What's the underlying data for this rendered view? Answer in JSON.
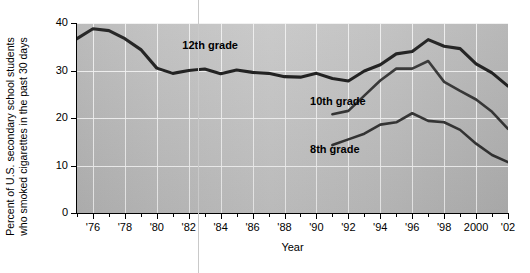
{
  "chart_data": {
    "type": "line",
    "title": "",
    "xlabel": "Year",
    "ylabel": "Percent of U.S. secondary school students who smoked cigarettes in the past 30 days",
    "ylabel_lines": [
      "Percent of U.S. secondary school students",
      "who smoked cigarettes in the past 30 days"
    ],
    "xlim": [
      1975,
      2002
    ],
    "ylim": [
      0,
      40
    ],
    "ytick_labels": [
      "0",
      "10",
      "20",
      "30",
      "40"
    ],
    "ytick_values": [
      0,
      10,
      20,
      30,
      40
    ],
    "xtick_labels": [
      "'76",
      "'78",
      "'80",
      "'82",
      "'84",
      "'86",
      "'88",
      "'90",
      "'92",
      "'94",
      "'96",
      "'98",
      "2000",
      "'02"
    ],
    "xtick_values": [
      1976,
      1978,
      1980,
      1982,
      1984,
      1986,
      1988,
      1990,
      1992,
      1994,
      1996,
      1998,
      2000,
      2002
    ],
    "xtick_minor_values": [
      1975,
      1977,
      1979,
      1981,
      1983,
      1985,
      1987,
      1989,
      1991,
      1993,
      1995,
      1997,
      1999,
      2001
    ],
    "grid": true,
    "legend_position": "inline-annotations",
    "series": [
      {
        "name": "12th grade",
        "label": "12th grade",
        "label_x": 1981.6,
        "label_y": 35.2,
        "x": [
          1975,
          1976,
          1977,
          1978,
          1979,
          1980,
          1981,
          1982,
          1983,
          1984,
          1985,
          1986,
          1987,
          1988,
          1989,
          1990,
          1991,
          1992,
          1993,
          1994,
          1995,
          1996,
          1997,
          1998,
          1999,
          2000,
          2001,
          2002
        ],
        "values": [
          36.7,
          38.8,
          38.4,
          36.7,
          34.4,
          30.5,
          29.4,
          30.0,
          30.3,
          29.3,
          30.1,
          29.6,
          29.4,
          28.7,
          28.6,
          29.4,
          28.3,
          27.8,
          29.9,
          31.2,
          33.5,
          34.0,
          36.5,
          35.1,
          34.6,
          31.4,
          29.5,
          26.7
        ]
      },
      {
        "name": "10th grade",
        "label": "10th grade",
        "label_x": 1989.6,
        "label_y": 23.3,
        "x": [
          1991,
          1992,
          1993,
          1994,
          1995,
          1996,
          1997,
          1998,
          1999,
          2000,
          2001,
          2002
        ],
        "values": [
          20.8,
          21.5,
          24.7,
          27.9,
          30.4,
          30.4,
          32.0,
          27.6,
          25.7,
          23.9,
          21.3,
          17.7
        ]
      },
      {
        "name": "8th grade",
        "label": "8th grade",
        "label_x": 1989.6,
        "label_y": 13.2,
        "x": [
          1991,
          1992,
          1993,
          1994,
          1995,
          1996,
          1997,
          1998,
          1999,
          2000,
          2001,
          2002
        ],
        "values": [
          14.3,
          15.5,
          16.7,
          18.6,
          19.1,
          21.0,
          19.4,
          19.1,
          17.5,
          14.6,
          12.2,
          10.7
        ]
      }
    ],
    "colors": {
      "line": "#111111",
      "plot_background": "#bdbdbd",
      "gridline": "#f2f2f2",
      "axis": "#000000"
    }
  }
}
